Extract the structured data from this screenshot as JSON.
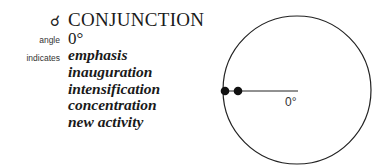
{
  "aspect": {
    "symbol": "☌",
    "symbol_icon": "conjunction-symbol-icon",
    "title": "CONJUNCTION",
    "angle_label": "angle",
    "angle_value": "0°",
    "indicates_label": "indicates",
    "indicates": [
      "emphasis",
      "inauguration",
      "intensification",
      "concentration",
      "new activity"
    ]
  },
  "diagram": {
    "circle": {
      "cx": 297,
      "cy": 90,
      "r": 74
    },
    "planet_points": [
      {
        "x": 225,
        "y": 91
      },
      {
        "x": 238,
        "y": 91
      }
    ],
    "line": {
      "x1": 225,
      "y1": 91,
      "x2": 298,
      "y2": 91
    },
    "angle_label": "0°",
    "colors": {
      "stroke": "#222222",
      "fill": "#111111"
    }
  }
}
